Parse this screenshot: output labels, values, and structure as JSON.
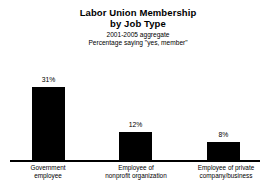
{
  "chart_data": {
    "type": "bar",
    "title": "Labor Union Membership by Job Type",
    "title_line1": "Labor Union Membership",
    "title_line2": "by Job Type",
    "subtitle_line1": "2001-2005 aggregate",
    "subtitle_line2": "Percentage saying \"yes, member\"",
    "categories": [
      "Government employee",
      "Employee of nonprofit organization",
      "Employee of private company/business"
    ],
    "category_lines": [
      [
        "Government",
        "employee"
      ],
      [
        "Employee of",
        "nonprofit organization"
      ],
      [
        "Employee of private",
        "company/business"
      ]
    ],
    "values": [
      31,
      12,
      8
    ],
    "value_labels": [
      "31%",
      "12%",
      "8%"
    ],
    "xlabel": "",
    "ylabel": "",
    "ylim": [
      0,
      35
    ],
    "grid": false,
    "legend": "none",
    "bar_color": "#000000",
    "background_color": "#ffffff",
    "axis_color": "#000000"
  }
}
